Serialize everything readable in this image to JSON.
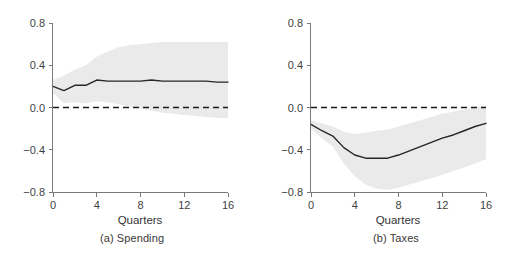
{
  "figure": {
    "background": "#ffffff",
    "band_color": "#eaeaea",
    "line_color": "#262626",
    "axis_color": "#7a7a7a"
  },
  "panels": [
    {
      "id": "a",
      "caption": "(a) Spending",
      "xlabel": "Quarters"
    },
    {
      "id": "b",
      "caption": "(b) Taxes",
      "xlabel": "Quarters"
    }
  ],
  "ticks": {
    "y_labels": [
      "0.8",
      "0.4",
      "0.0",
      "−0.4",
      "−0.8"
    ],
    "y_values": [
      0.8,
      0.4,
      0.0,
      -0.4,
      -0.8
    ],
    "x_labels": [
      "0",
      "4",
      "8",
      "12",
      "16"
    ],
    "x_values": [
      0,
      4,
      8,
      12,
      16
    ]
  },
  "chart_data": [
    {
      "type": "line",
      "title": "(a) Spending",
      "xlabel": "Quarters",
      "ylabel": "",
      "xlim": [
        0,
        16
      ],
      "ylim": [
        -0.8,
        0.8
      ],
      "xticks": [
        0,
        4,
        8,
        12,
        16
      ],
      "yticks": [
        0.8,
        0.4,
        0.0,
        -0.4,
        -0.8
      ],
      "grid": false,
      "legend": "none",
      "annotations": [
        "dashed zero reference line at y = 0.0"
      ],
      "x": [
        0,
        1,
        2,
        3,
        4,
        5,
        6,
        7,
        8,
        9,
        10,
        11,
        12,
        13,
        14,
        15,
        16
      ],
      "series": [
        {
          "name": "Impulse response (point estimate)",
          "values": [
            0.2,
            0.16,
            0.21,
            0.21,
            0.26,
            0.25,
            0.25,
            0.25,
            0.25,
            0.26,
            0.25,
            0.25,
            0.25,
            0.25,
            0.25,
            0.24,
            0.24
          ]
        },
        {
          "name": "Confidence band upper",
          "values": [
            0.26,
            0.3,
            0.36,
            0.4,
            0.48,
            0.53,
            0.57,
            0.59,
            0.6,
            0.61,
            0.62,
            0.62,
            0.62,
            0.62,
            0.62,
            0.62,
            0.62
          ]
        },
        {
          "name": "Confidence band lower",
          "values": [
            0.14,
            0.04,
            0.05,
            0.04,
            0.06,
            0.05,
            0.03,
            0.01,
            -0.01,
            -0.03,
            -0.05,
            -0.06,
            -0.07,
            -0.08,
            -0.09,
            -0.1,
            -0.1
          ]
        }
      ]
    },
    {
      "type": "line",
      "title": "(b) Taxes",
      "xlabel": "Quarters",
      "ylabel": "",
      "xlim": [
        0,
        16
      ],
      "ylim": [
        -0.8,
        0.8
      ],
      "xticks": [
        0,
        4,
        8,
        12,
        16
      ],
      "yticks": [
        0.8,
        0.4,
        0.0,
        -0.4,
        -0.8
      ],
      "grid": false,
      "legend": "none",
      "annotations": [
        "dashed zero reference line at y = 0.0"
      ],
      "x": [
        0,
        1,
        2,
        3,
        4,
        5,
        6,
        7,
        8,
        9,
        10,
        11,
        12,
        13,
        14,
        15,
        16
      ],
      "series": [
        {
          "name": "Impulse response (point estimate)",
          "values": [
            -0.16,
            -0.22,
            -0.27,
            -0.38,
            -0.45,
            -0.48,
            -0.48,
            -0.48,
            -0.45,
            -0.41,
            -0.37,
            -0.33,
            -0.29,
            -0.26,
            -0.22,
            -0.18,
            -0.15
          ]
        },
        {
          "name": "Confidence band upper",
          "values": [
            -0.12,
            -0.15,
            -0.18,
            -0.23,
            -0.25,
            -0.24,
            -0.22,
            -0.21,
            -0.18,
            -0.15,
            -0.12,
            -0.09,
            -0.06,
            -0.04,
            -0.02,
            0.0,
            0.02
          ]
        },
        {
          "name": "Confidence band lower",
          "values": [
            -0.2,
            -0.29,
            -0.37,
            -0.53,
            -0.65,
            -0.73,
            -0.77,
            -0.78,
            -0.76,
            -0.73,
            -0.7,
            -0.67,
            -0.64,
            -0.6,
            -0.57,
            -0.53,
            -0.49
          ]
        }
      ]
    }
  ]
}
